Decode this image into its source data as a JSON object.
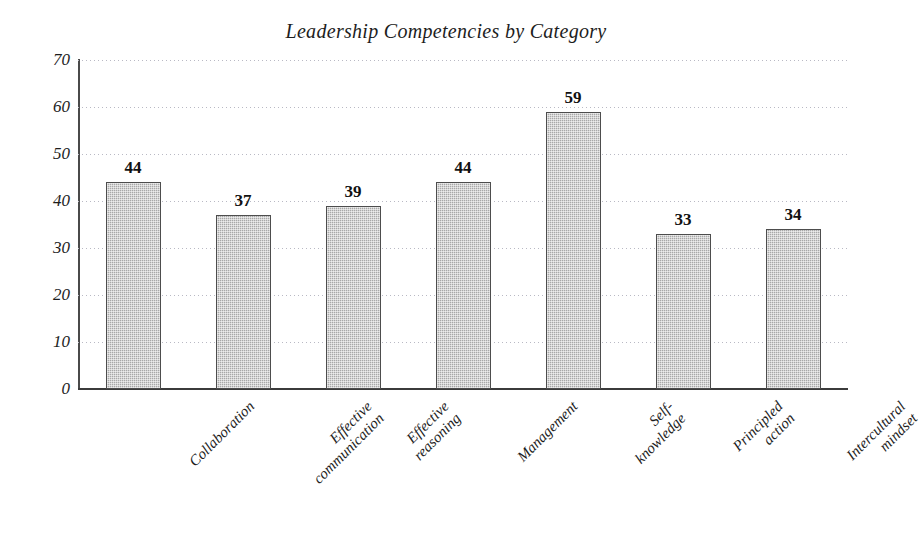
{
  "chart_data": {
    "type": "bar",
    "title": "Leadership Competencies by Category",
    "xlabel": "",
    "ylabel": "",
    "ylim": [
      0,
      70
    ],
    "yticks": [
      0,
      10,
      20,
      30,
      40,
      50,
      60,
      70
    ],
    "grid": "horizontal-dotted",
    "legend": "none",
    "categories": [
      "Collaboration",
      "Effective communication",
      "Effective reasoning",
      "Management",
      "Self-knowledge",
      "Principled action",
      "Intercultural mindset"
    ],
    "category_lines": [
      [
        "Collaboration"
      ],
      [
        "Effective",
        "communication"
      ],
      [
        "Effective",
        "reasoning"
      ],
      [
        "Management"
      ],
      [
        "Self-",
        "knowledge"
      ],
      [
        "Principled",
        "action"
      ],
      [
        "Intercultural",
        "mindset"
      ]
    ],
    "values": [
      44,
      37,
      39,
      44,
      59,
      33,
      34
    ],
    "data_labels": [
      "44",
      "37",
      "39",
      "44",
      "59",
      "33",
      "34"
    ],
    "colors": {
      "bar_fill": "#a8a8a8",
      "bar_border": "#4d4d4d",
      "gridline": "#b9b9c4",
      "axis": "#3b3b3b",
      "text": "#1d1d1d",
      "background": "#ffffff"
    }
  }
}
